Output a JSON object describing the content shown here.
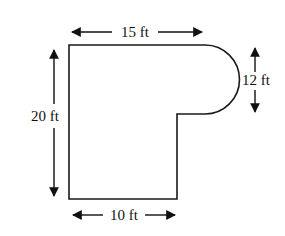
{
  "diagram": {
    "type": "floor-plan-shape",
    "stroke_color": "#1a1a1a",
    "background": "#ffffff",
    "labels": {
      "top": "15 ft",
      "right": "12 ft",
      "left": "20 ft",
      "bottom": "10 ft"
    },
    "dimensions": {
      "top_width_ft": 15,
      "semicircle_diameter_ft": 12,
      "total_height_ft": 20,
      "bottom_width_ft": 10
    }
  }
}
